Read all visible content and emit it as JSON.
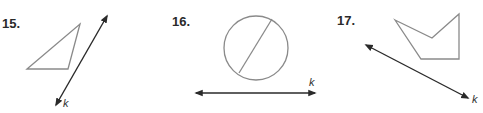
{
  "problems": [
    {
      "number": "15.",
      "line_label": "k",
      "figure": "triangle",
      "line_direction": "diagonal-up-right"
    },
    {
      "number": "16.",
      "line_label": "k",
      "figure": "circle-with-chord",
      "line_direction": "horizontal"
    },
    {
      "number": "17.",
      "line_label": "k",
      "figure": "concave-pentagon",
      "line_direction": "diagonal-down-right"
    }
  ],
  "colors": {
    "figure_stroke": "#8a8a8a",
    "line_stroke": "#2a2a2a",
    "text": "#2a2a2a"
  }
}
